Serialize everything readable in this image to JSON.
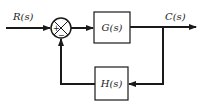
{
  "diagram": {
    "type": "feedback-control-block-diagram",
    "input_label": "R(s)",
    "output_label": "C(s)",
    "summing_junction": {
      "plus_sign": "+",
      "minus_sign": "−"
    },
    "forward_block": {
      "label": "G(s)"
    },
    "feedback_block": {
      "label": "H(s)"
    },
    "colors": {
      "line": "#1a1a1a",
      "background": "#ffffff"
    }
  }
}
